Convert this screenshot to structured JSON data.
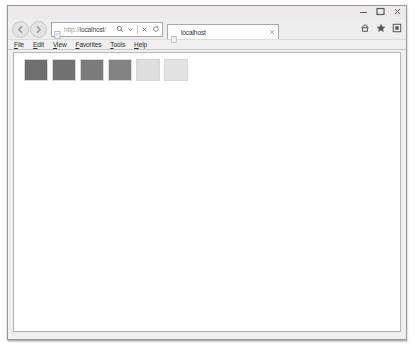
{
  "window": {
    "controls": [
      {
        "name": "minimize",
        "glyph": "minimize-icon"
      },
      {
        "name": "maximize",
        "glyph": "maximize-icon"
      },
      {
        "name": "close",
        "glyph": "close-icon"
      }
    ]
  },
  "navigation": {
    "back_label": "Back",
    "forward_label": "Forward",
    "address": {
      "url_prefix": "http://",
      "url_host": "localhost",
      "url_suffix": "/",
      "placeholder": "localhost",
      "search_icon": "search-icon",
      "dropdown_icon": "chevron-down-icon",
      "stop_icon": "stop-icon",
      "refresh_icon": "refresh-icon"
    },
    "tab": {
      "title": "localhost",
      "close_label": "×"
    },
    "command_icons": [
      {
        "name": "home-icon",
        "label": "Home"
      },
      {
        "name": "favorites-star-icon",
        "label": "Favorites"
      },
      {
        "name": "tools-gear-icon",
        "label": "Tools"
      }
    ]
  },
  "menu_bar": {
    "items": [
      {
        "mnemonic": "F",
        "rest": "ile"
      },
      {
        "mnemonic": "E",
        "rest": "dit"
      },
      {
        "mnemonic": "V",
        "rest": "iew"
      },
      {
        "mnemonic": "F",
        "rest": "avorites"
      },
      {
        "mnemonic": "T",
        "rest": "ools"
      },
      {
        "mnemonic": "H",
        "rest": "elp"
      }
    ]
  },
  "content": {
    "swatches": [
      {
        "index": 1,
        "color": "#6e6e6e"
      },
      {
        "index": 2,
        "color": "#717171"
      },
      {
        "index": 3,
        "color": "#7b7b7b"
      },
      {
        "index": 4,
        "color": "#828282"
      },
      {
        "index": 5,
        "color": "#dedede"
      },
      {
        "index": 6,
        "color": "#e2e2e2"
      }
    ]
  }
}
